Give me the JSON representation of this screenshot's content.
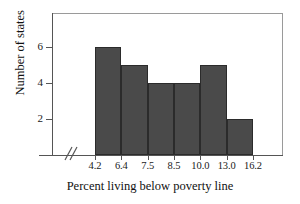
{
  "chart_data": {
    "type": "bar",
    "title": "",
    "subtitle": "",
    "xlabel": "Percent living below poverty line",
    "ylabel": "Number of states",
    "categories": [
      "4.2-6.4",
      "6.4-7.5",
      "7.5-8.5",
      "8.5-10.0",
      "10.0-13.0",
      "13.0-16.2"
    ],
    "values": [
      6,
      5,
      4,
      4,
      5,
      2
    ],
    "bin_edges": [
      "4.2",
      "6.4",
      "7.5",
      "8.5",
      "10.0",
      "13.0",
      "16.2"
    ],
    "x_tick_labels": [
      "4.2",
      "6.4",
      "7.5",
      "8.5",
      "10.0",
      "13.0",
      "16.2"
    ],
    "y_tick_labels": [
      "2",
      "4",
      "6"
    ],
    "y_tick_values": [
      2,
      4,
      6
    ],
    "ylim": [
      0,
      7
    ],
    "grid": false,
    "legend": false,
    "legend_position": "none",
    "axis_break": "//",
    "bar_fill_color": "#4a4a4a",
    "bar_edge_color": "#2b2b2b",
    "axis_color": "#555555",
    "frame_color": "#9a9a9a",
    "background_color": "#ffffff",
    "text_color": "#111111",
    "annotations": [
      "axis break on x-axis between origin and first bin"
    ]
  }
}
